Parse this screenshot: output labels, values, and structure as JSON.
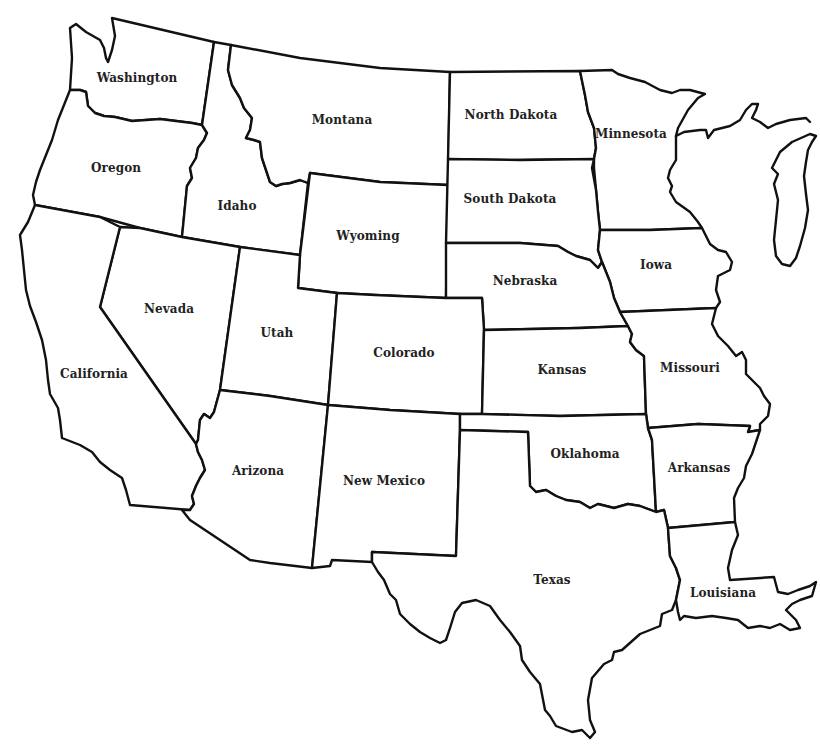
{
  "map": {
    "title": "Western and Central United States",
    "line_color": "#111111",
    "fill_color": "#ffffff",
    "states": [
      {
        "id": "washington",
        "label": "Washington",
        "x": 137,
        "y": 78
      },
      {
        "id": "oregon",
        "label": "Oregon",
        "x": 116,
        "y": 168
      },
      {
        "id": "idaho",
        "label": "Idaho",
        "x": 237,
        "y": 206
      },
      {
        "id": "montana",
        "label": "Montana",
        "x": 342,
        "y": 120
      },
      {
        "id": "wyoming",
        "label": "Wyoming",
        "x": 368,
        "y": 236
      },
      {
        "id": "north-dakota",
        "label": "North Dakota",
        "x": 511,
        "y": 115
      },
      {
        "id": "south-dakota",
        "label": "South Dakota",
        "x": 510,
        "y": 199
      },
      {
        "id": "minnesota",
        "label": "Minnesota",
        "x": 631,
        "y": 134
      },
      {
        "id": "iowa",
        "label": "Iowa",
        "x": 656,
        "y": 265
      },
      {
        "id": "nebraska",
        "label": "Nebraska",
        "x": 525,
        "y": 281
      },
      {
        "id": "nevada",
        "label": "Nevada",
        "x": 169,
        "y": 309
      },
      {
        "id": "utah",
        "label": "Utah",
        "x": 277,
        "y": 333
      },
      {
        "id": "colorado",
        "label": "Colorado",
        "x": 404,
        "y": 353
      },
      {
        "id": "kansas",
        "label": "Kansas",
        "x": 562,
        "y": 370
      },
      {
        "id": "missouri",
        "label": "Missouri",
        "x": 690,
        "y": 368
      },
      {
        "id": "california",
        "label": "California",
        "x": 94,
        "y": 374
      },
      {
        "id": "arizona",
        "label": "Arizona",
        "x": 258,
        "y": 471
      },
      {
        "id": "new-mexico",
        "label": "New Mexico",
        "x": 384,
        "y": 481
      },
      {
        "id": "oklahoma",
        "label": "Oklahoma",
        "x": 585,
        "y": 454
      },
      {
        "id": "arkansas",
        "label": "Arkansas",
        "x": 699,
        "y": 468
      },
      {
        "id": "texas",
        "label": "Texas",
        "x": 552,
        "y": 580
      },
      {
        "id": "louisiana",
        "label": "Louisiana",
        "x": 723,
        "y": 593
      }
    ]
  }
}
